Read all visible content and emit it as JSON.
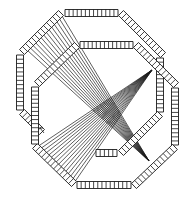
{
  "diagram": {
    "width": 189,
    "height": 198,
    "background": "#ffffff",
    "stroke_color": "#1a1a1a",
    "octagons": [
      {
        "name": "back-octagon",
        "bar_width": 7,
        "segment_spacing": 4.2,
        "edges": [
          {
            "name": "top",
            "from": [
              65,
              13
            ],
            "to": [
              118,
              13
            ]
          },
          {
            "name": "upper-right",
            "from": [
              121,
              13
            ],
            "to": [
              163,
              55
            ]
          },
          {
            "name": "right",
            "from": [
              160,
              58
            ],
            "to": [
              160,
              112
            ]
          },
          {
            "name": "lower-right",
            "from": [
              160,
              114
            ],
            "to": [
              121,
              153
            ]
          },
          {
            "name": "bottom",
            "from": [
              117,
              153
            ],
            "to": [
              96,
              153
            ]
          },
          {
            "name": "lower-left",
            "from": [
              42,
              132
            ],
            "to": [
              22,
              112
            ]
          },
          {
            "name": "left",
            "from": [
              20,
              110
            ],
            "to": [
              20,
              55
            ]
          },
          {
            "name": "upper-left",
            "from": [
              22,
              52
            ],
            "to": [
              61,
              13
            ]
          }
        ]
      },
      {
        "name": "front-octagon",
        "bar_width": 7,
        "segment_spacing": 4.2,
        "edges": [
          {
            "name": "top",
            "from": [
              80,
              45
            ],
            "to": [
              133,
              45
            ]
          },
          {
            "name": "upper-right",
            "from": [
              136,
              45
            ],
            "to": [
              176,
              85
            ]
          },
          {
            "name": "right",
            "from": [
              175,
              88
            ],
            "to": [
              175,
              145
            ]
          },
          {
            "name": "lower-right",
            "from": [
              175,
              147
            ],
            "to": [
              134,
              186
            ]
          },
          {
            "name": "bottom",
            "from": [
              131,
              185
            ],
            "to": [
              77,
              185
            ]
          },
          {
            "name": "lower-left",
            "from": [
              74,
              184
            ],
            "to": [
              35,
              146
            ]
          },
          {
            "name": "left",
            "from": [
              35,
              144
            ],
            "to": [
              35,
              87
            ]
          },
          {
            "name": "upper-left",
            "from": [
              37,
              84
            ],
            "to": [
              77,
              45
            ]
          }
        ]
      }
    ],
    "fans": [
      {
        "name": "upper-fan",
        "apex": [
          152,
          70
        ],
        "target_from": [
          37,
          147
        ],
        "target_to": [
          74,
          183
        ],
        "count": 16,
        "color": "#1a1a1a"
      },
      {
        "name": "lower-fan",
        "apex": [
          149,
          161
        ],
        "target_from": [
          27,
          50
        ],
        "target_to": [
          62,
          16
        ],
        "count": 14,
        "color": "#1a1a1a"
      }
    ],
    "marks": [
      {
        "name": "tick-mark-left",
        "from": [
          40,
          128
        ],
        "to": [
          44,
          133
        ]
      },
      {
        "name": "tick-mark-left-bar",
        "from": [
          38,
          128
        ],
        "to": [
          43,
          128
        ]
      }
    ]
  }
}
